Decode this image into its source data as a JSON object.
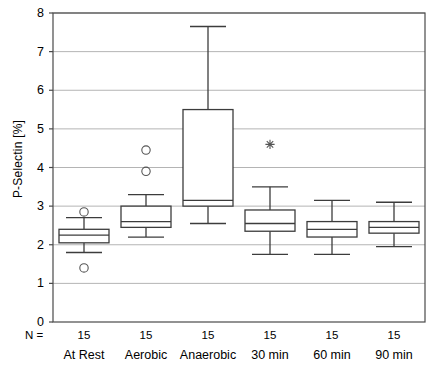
{
  "chart_data": {
    "type": "box",
    "title": "",
    "xlabel": "",
    "ylabel": "P-Selectin [%]",
    "ylim": [
      0,
      8
    ],
    "ytick_labels": [
      "0",
      "1",
      "2",
      "3",
      "4",
      "5",
      "6",
      "7",
      "8"
    ],
    "ytick_values": [
      0,
      1,
      2,
      3,
      4,
      5,
      6,
      7,
      8
    ],
    "grid": "horizontal",
    "legend": "none",
    "n_row_label": "N =",
    "categories": [
      "At Rest",
      "Aerobic",
      "Anaerobic",
      "30 min",
      "60 min",
      "90 min"
    ],
    "n_values": [
      "15",
      "15",
      "15",
      "15",
      "15",
      "15"
    ],
    "boxes": [
      {
        "category": "At Rest",
        "n": "15",
        "whisker_low": 1.8,
        "q1": 2.05,
        "median": 2.25,
        "q3": 2.4,
        "whisker_high": 2.7,
        "outliers": [
          2.85,
          1.4
        ],
        "extremes": []
      },
      {
        "category": "Aerobic",
        "n": "15",
        "whisker_low": 2.2,
        "q1": 2.45,
        "median": 2.6,
        "q3": 3.0,
        "whisker_high": 3.3,
        "outliers": [
          4.45,
          3.9
        ],
        "extremes": []
      },
      {
        "category": "Anaerobic",
        "n": "15",
        "whisker_low": 2.55,
        "q1": 3.0,
        "median": 3.15,
        "q3": 5.5,
        "whisker_high": 7.65,
        "outliers": [],
        "extremes": []
      },
      {
        "category": "30 min",
        "n": "15",
        "whisker_low": 1.75,
        "q1": 2.35,
        "median": 2.55,
        "q3": 2.9,
        "whisker_high": 3.5,
        "outliers": [],
        "extremes": [
          4.6
        ]
      },
      {
        "category": "60 min",
        "n": "15",
        "whisker_low": 1.75,
        "q1": 2.2,
        "median": 2.4,
        "q3": 2.6,
        "whisker_high": 3.15,
        "outliers": [],
        "extremes": []
      },
      {
        "category": "90 min",
        "n": "15",
        "whisker_low": 1.95,
        "q1": 2.3,
        "median": 2.45,
        "q3": 2.6,
        "whisker_high": 3.1,
        "outliers": [],
        "extremes": []
      }
    ],
    "colors": {
      "axis": "#4a4a4a",
      "grid": "#b4b4b4",
      "box_stroke": "#3c3c3c",
      "box_fill": "#ffffff",
      "marker": "#555555"
    }
  }
}
